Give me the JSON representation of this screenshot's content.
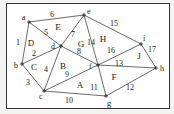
{
  "diagram": {
    "type": "planar-graph",
    "vertices": [
      {
        "id": "a",
        "x": 29,
        "y": 22,
        "label": "a",
        "lx": 22,
        "ly": 20
      },
      {
        "id": "b",
        "x": 22,
        "y": 64,
        "label": "b",
        "lx": 14,
        "ly": 68
      },
      {
        "id": "c",
        "x": 44,
        "y": 91,
        "label": "c",
        "lx": 39,
        "ly": 99
      },
      {
        "id": "d",
        "x": 61,
        "y": 46,
        "label": "d",
        "lx": 51,
        "ly": 49
      },
      {
        "id": "e",
        "x": 84,
        "y": 15,
        "label": "e",
        "lx": 87,
        "ly": 14
      },
      {
        "id": "f",
        "x": 98,
        "y": 65,
        "label": "f",
        "lx": 89,
        "ly": 69
      },
      {
        "id": "g",
        "x": 106,
        "y": 96,
        "label": "g",
        "lx": 107,
        "ly": 106
      },
      {
        "id": "h",
        "x": 156,
        "y": 68,
        "label": "h",
        "lx": 160,
        "ly": 71
      },
      {
        "id": "i",
        "x": 141,
        "y": 44,
        "label": "i",
        "lx": 143,
        "ly": 41
      }
    ],
    "edges": [
      {
        "label": "1",
        "from": "a",
        "to": "b",
        "lx": 18,
        "ly": 45
      },
      {
        "label": "2",
        "from": "b",
        "to": "d",
        "lx": 34,
        "ly": 56
      },
      {
        "label": "3",
        "from": "b",
        "to": "c",
        "lx": 28,
        "ly": 85
      },
      {
        "label": "4",
        "from": "d",
        "to": "c",
        "lx": 46,
        "ly": 72
      },
      {
        "label": "5",
        "from": "a",
        "to": "d",
        "lx": 46,
        "ly": 35
      },
      {
        "label": "6",
        "from": "a",
        "to": "e",
        "lx": 52,
        "ly": 17
      },
      {
        "label": "7",
        "from": "e",
        "to": "d",
        "lx": 73,
        "ly": 37
      },
      {
        "label": "8",
        "from": "d",
        "to": "f",
        "lx": 79,
        "ly": 54
      },
      {
        "label": "9",
        "from": "c",
        "to": "f",
        "lx": 67,
        "ly": 77
      },
      {
        "label": "10",
        "from": "c",
        "to": "g",
        "lx": 69,
        "ly": 103
      },
      {
        "label": "11",
        "from": "f",
        "to": "g",
        "lx": 94,
        "ly": 90
      },
      {
        "label": "12",
        "from": "g",
        "to": "h",
        "lx": 130,
        "ly": 90
      },
      {
        "label": "13",
        "from": "f",
        "to": "h",
        "lx": 119,
        "ly": 66
      },
      {
        "label": "14",
        "from": "e",
        "to": "f",
        "lx": 91,
        "ly": 45
      },
      {
        "label": "15",
        "from": "e",
        "to": "i",
        "lx": 114,
        "ly": 26
      },
      {
        "label": "16",
        "from": "f",
        "to": "i",
        "lx": 111,
        "ly": 53
      },
      {
        "label": "17",
        "from": "i",
        "to": "h",
        "lx": 152,
        "ly": 52
      }
    ],
    "regions": [
      {
        "label": "A",
        "x": 80,
        "y": 88
      },
      {
        "label": "B",
        "x": 63,
        "y": 69
      },
      {
        "label": "C",
        "x": 34,
        "y": 70
      },
      {
        "label": "D",
        "x": 31,
        "y": 46
      },
      {
        "label": "E",
        "x": 58,
        "y": 30
      },
      {
        "label": "F",
        "x": 114,
        "y": 80
      },
      {
        "label": "G",
        "x": 81,
        "y": 47
      },
      {
        "label": "H",
        "x": 103,
        "y": 42
      },
      {
        "label": "J",
        "x": 139,
        "y": 59
      }
    ]
  }
}
